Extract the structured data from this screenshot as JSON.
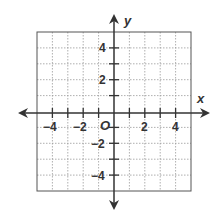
{
  "diagram": {
    "type": "coordinate-plane",
    "x_axis_label": "x",
    "y_axis_label": "y",
    "origin_label": "O",
    "x_range": [
      -5,
      5
    ],
    "y_range": [
      -5,
      5
    ],
    "x_tick_labels": [
      "−4",
      "−2",
      "2",
      "4"
    ],
    "y_tick_labels": [
      "4",
      "2",
      "−2",
      "−4"
    ],
    "grid": "dotted",
    "colors": {
      "axis": "#333333",
      "grid": "#999999",
      "border": "#555555"
    }
  }
}
